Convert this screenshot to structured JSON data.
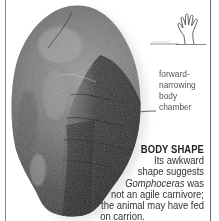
{
  "colors": {
    "border": "#7a7a7a",
    "text": "#333333",
    "annotation_text": "#555555",
    "fossil_dark": "#2a2a2a",
    "fossil_mid": "#5a5a5a",
    "fossil_light": "#9a9a9a"
  },
  "scale_icon": {
    "name": "hand-scale-icon"
  },
  "annotation": {
    "lines": [
      "forward-",
      "narrowing",
      "body",
      "chamber"
    ]
  },
  "caption": {
    "title": "BODY SHAPE",
    "line1": "Its awkward",
    "line2": "shape suggests",
    "line3_italic": "Gomphoceras",
    "line3_rest": " was",
    "line4": "not an agile carnivore;",
    "line5": "the animal may have fed",
    "line6": "on carrion."
  }
}
